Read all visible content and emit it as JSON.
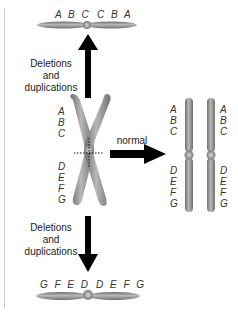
{
  "top": {
    "genes_left": "A B C",
    "genes_right": "C B A",
    "caption_lines": [
      "Deletions",
      "and",
      "duplications"
    ]
  },
  "center": {
    "left_genes": [
      "A",
      "B",
      "C",
      "D",
      "E",
      "F",
      "G"
    ],
    "arrow_label": "normal",
    "right_genes_a": [
      "A",
      "B",
      "C",
      "D",
      "E",
      "F",
      "G"
    ],
    "right_genes_b": [
      "A",
      "B",
      "C",
      "D",
      "E",
      "F",
      "G"
    ]
  },
  "bottom": {
    "caption_lines": [
      "Deletions",
      "and",
      "duplications"
    ],
    "genes_left": "G F E D",
    "genes_right": "D E F G"
  },
  "colors": {
    "chromosome": "#8a8a8a",
    "chromosome_highlight": "#b5b5b5",
    "arrow": "#000000",
    "text": "#333333"
  }
}
